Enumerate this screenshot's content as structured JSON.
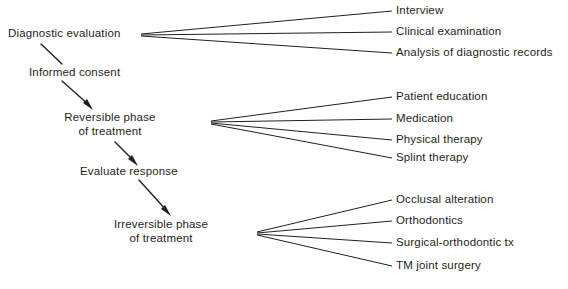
{
  "diagram": {
    "background_color": "#ffffff",
    "line_color": "#231f20",
    "text_color": "#231f20",
    "spine": {
      "nodes": [
        {
          "id": "diagnostic-evaluation",
          "label": "Diagnostic evaluation",
          "line1": "Diagnostic evaluation",
          "line2": ""
        },
        {
          "id": "informed-consent",
          "label": "Informed consent",
          "line1": "Informed consent",
          "line2": ""
        },
        {
          "id": "reversible-phase",
          "label": "Reversible phase of treatment",
          "line1": "Reversible phase",
          "line2": "of treatment"
        },
        {
          "id": "evaluate-response",
          "label": "Evaluate response",
          "line1": "Evaluate response",
          "line2": ""
        },
        {
          "id": "irreversible-phase",
          "label": "Irreversible phase of treatment",
          "line1": "Irreversible phase",
          "line2": "of treatment"
        }
      ]
    },
    "branch_groups": [
      {
        "id": "diagnostic-evaluation-branches",
        "source": "Diagnostic evaluation",
        "items": [
          {
            "label": "Interview"
          },
          {
            "label": "Clinical examination"
          },
          {
            "label": "Analysis of diagnostic records"
          }
        ]
      },
      {
        "id": "reversible-phase-branches",
        "source": "Reversible phase of treatment",
        "items": [
          {
            "label": "Patient education"
          },
          {
            "label": "Medication"
          },
          {
            "label": "Physical therapy"
          },
          {
            "label": "Splint therapy"
          }
        ]
      },
      {
        "id": "irreversible-phase-branches",
        "source": "Irreversible phase of treatment",
        "items": [
          {
            "label": "Occlusal alteration"
          },
          {
            "label": "Orthodontics"
          },
          {
            "label": "Surgical-orthodontic tx"
          },
          {
            "label": "TM joint surgery"
          }
        ]
      }
    ]
  }
}
